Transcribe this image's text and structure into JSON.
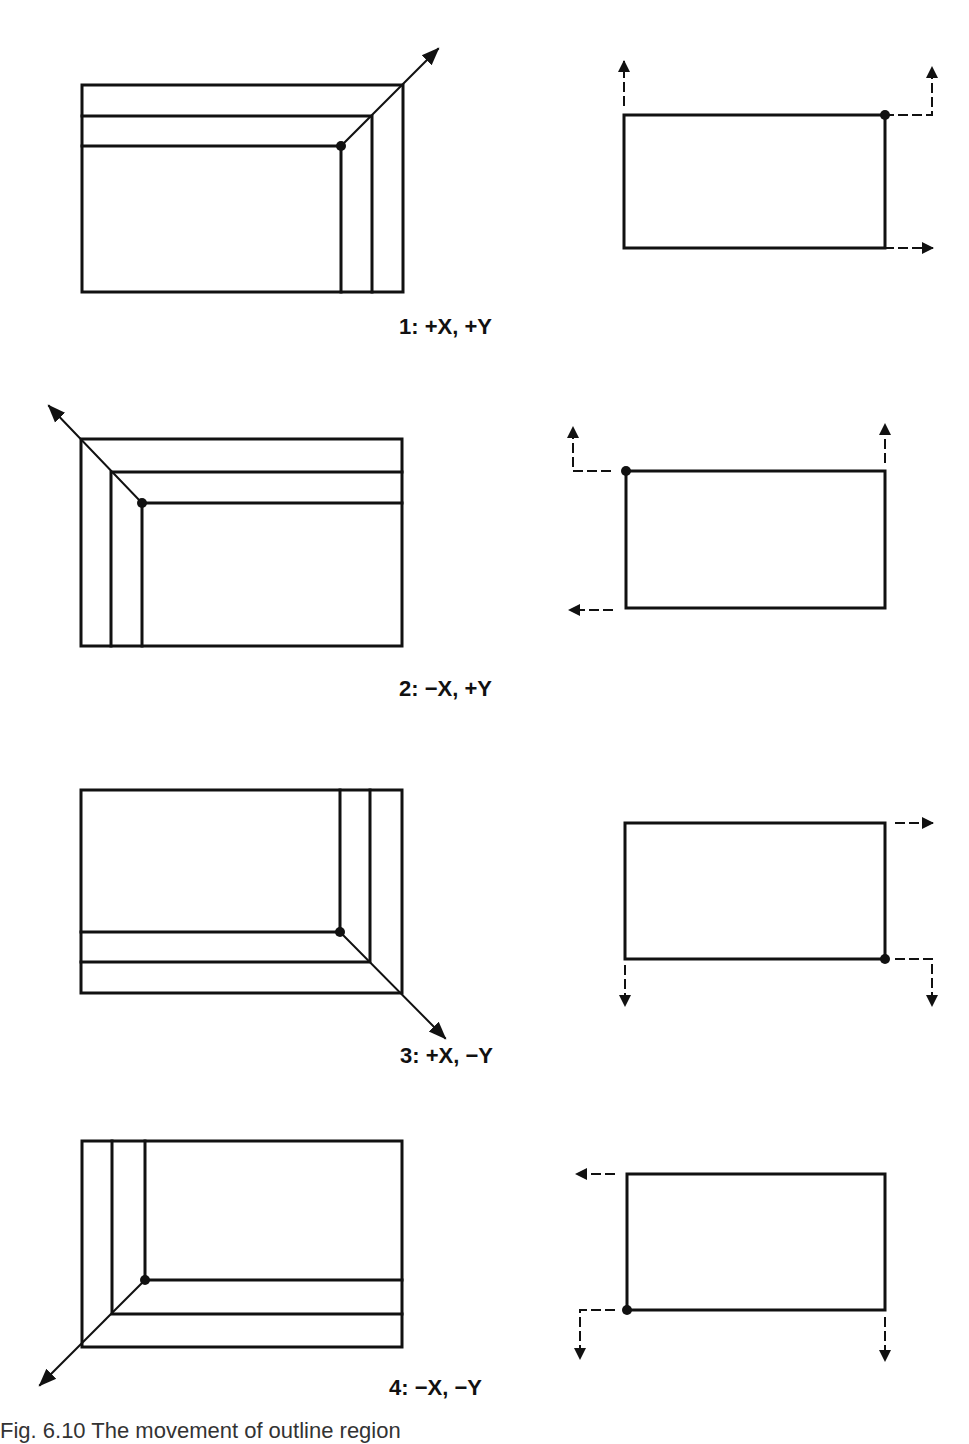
{
  "figure": {
    "panels": [
      {
        "id": 1,
        "label": "1: +X, +Y",
        "growth_corner": "top-right",
        "direction_x": "+X",
        "direction_y": "+Y"
      },
      {
        "id": 2,
        "label": "2: −X, +Y",
        "growth_corner": "top-left",
        "direction_x": "-X",
        "direction_y": "+Y"
      },
      {
        "id": 3,
        "label": "3: +X, −Y",
        "growth_corner": "bottom-right",
        "direction_x": "+X",
        "direction_y": "-Y"
      },
      {
        "id": 4,
        "label": "4: −X, −Y",
        "growth_corner": "bottom-left",
        "direction_x": "-X",
        "direction_y": "-Y"
      }
    ],
    "bottom_caption_partial": "Fig. 6.10  The movement of outline region"
  },
  "colors": {
    "ink": "#111111",
    "background": "#ffffff"
  }
}
